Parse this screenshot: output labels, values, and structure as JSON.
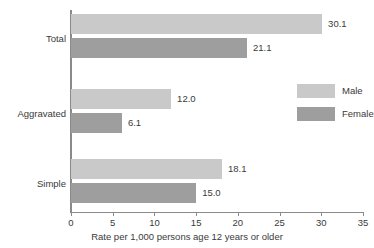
{
  "chart_data": {
    "type": "bar",
    "orientation": "horizontal",
    "title": "",
    "categories": [
      "Total",
      "Aggravated",
      "Simple"
    ],
    "series": [
      {
        "name": "Male",
        "color": "#c9c9c9",
        "values": [
          30.1,
          12.0,
          18.1
        ],
        "labels": [
          "30.1",
          "12.0",
          "18.1"
        ]
      },
      {
        "name": "Female",
        "color": "#9e9e9e",
        "values": [
          21.1,
          6.1,
          15.0
        ],
        "labels": [
          "21.1",
          "6.1",
          "15.0"
        ]
      }
    ],
    "xlabel": "Rate per 1,000 persons age 12 years or older",
    "ylabel": "",
    "xlim": [
      0,
      35
    ],
    "xticks": [
      0,
      5,
      10,
      15,
      20,
      25,
      30,
      35
    ],
    "xtick_labels": [
      "0",
      "5",
      "10",
      "15",
      "20",
      "25",
      "30",
      "35"
    ],
    "grid": false,
    "legend_position": "right"
  },
  "legend": {
    "items": [
      {
        "label": "Male"
      },
      {
        "label": "Female"
      }
    ]
  }
}
